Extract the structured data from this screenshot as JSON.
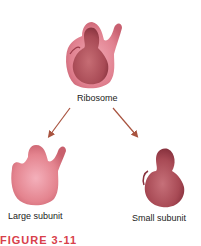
{
  "figure": {
    "title_label": "Ribosome",
    "left_label": "Large subunit",
    "right_label": "Small subunit",
    "caption": "FIGURE 3-11"
  },
  "colors": {
    "arrow": "#a8533f",
    "large_subunit_fill": "#e58a98",
    "small_subunit_fill": "#b5555f",
    "caption": "#d8404a"
  }
}
